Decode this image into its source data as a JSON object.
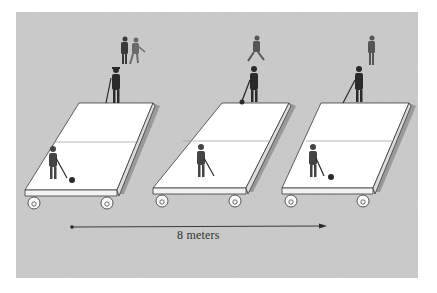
{
  "diagram": {
    "distance_label": "8 meters",
    "colors": {
      "background_panel": "#c4c4c4",
      "platform_top": "#ffffff",
      "platform_edge": "#3a3a3a",
      "figure": "#2a2a2a",
      "arrow": "#2a2a2a",
      "page": "#ffffff"
    },
    "panels": [
      {
        "id": "platform-1",
        "players_on_platform": 2,
        "bystanders": 2
      },
      {
        "id": "platform-2",
        "players_on_platform": 2,
        "bystanders": 1
      },
      {
        "id": "platform-3",
        "players_on_platform": 2,
        "bystanders": 1
      }
    ]
  }
}
